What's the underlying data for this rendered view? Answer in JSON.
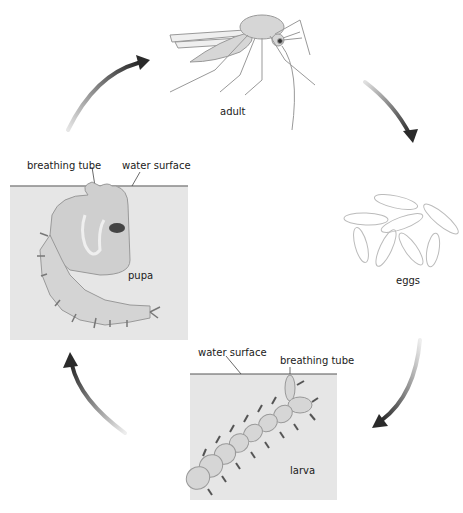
{
  "diagram": {
    "type": "life-cycle",
    "stages": [
      {
        "id": "adult",
        "label": "adult"
      },
      {
        "id": "eggs",
        "label": "eggs"
      },
      {
        "id": "larva",
        "label": "larva"
      },
      {
        "id": "pupa",
        "label": "pupa"
      }
    ],
    "cycle_order": [
      "adult",
      "eggs",
      "larva",
      "pupa",
      "adult"
    ],
    "pupa_panel": {
      "label": "pupa",
      "callouts": {
        "breathing_tube": "breathing tube",
        "water_surface": "water surface"
      }
    },
    "larva_panel": {
      "label": "larva",
      "callouts": {
        "water_surface": "water surface",
        "breathing_tube": "breathing tube"
      }
    },
    "colors": {
      "water": "#e6e6e6",
      "surface_line": "#888888",
      "arrow_dark": "#2a2a2a",
      "arrow_light": "#d8d8d8",
      "body_fill": "#d0d0d0"
    }
  }
}
